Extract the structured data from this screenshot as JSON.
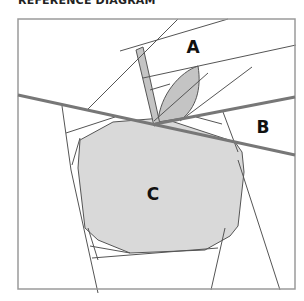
{
  "title": "REFERENCE DIAGRAM",
  "labels": {
    "a": "A",
    "b": "B",
    "c": "C"
  },
  "colors": {
    "frame": "#9a9a9a",
    "thin_line": "#555555",
    "thick_line": "#777777",
    "fill_light": "#d9d9d9",
    "fill_dark": "#c4c4c4",
    "background": "#ffffff",
    "label": "#111111"
  },
  "regions": [
    {
      "id": "A",
      "description": "upper right section containing leaf"
    },
    {
      "id": "B",
      "description": "right middle section between two thick lines"
    },
    {
      "id": "C",
      "description": "apple body region"
    }
  ]
}
